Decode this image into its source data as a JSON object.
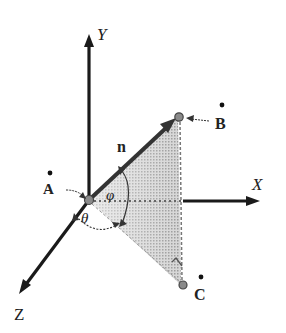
{
  "diagram": {
    "type": "3d-coordinate-vector-angles",
    "axes": {
      "x_label": "X",
      "y_label": "Y",
      "z_label": "Z"
    },
    "vector": {
      "label": "n"
    },
    "points": [
      {
        "id": "A",
        "label": "A"
      },
      {
        "id": "B",
        "label": "B"
      },
      {
        "id": "C",
        "label": "C"
      }
    ],
    "angles": {
      "phi_label": "φ",
      "theta_label": "θ"
    },
    "colors": {
      "axis": "#1a1a1a",
      "shade": "#b8b8b8",
      "marker_fill": "#888888",
      "text": "#222222"
    }
  }
}
